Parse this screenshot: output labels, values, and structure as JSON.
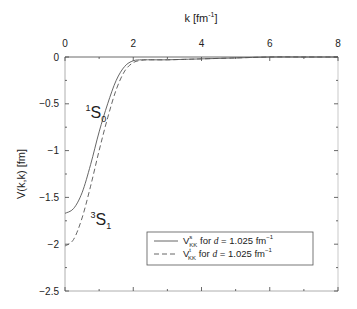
{
  "chart_data": {
    "type": "line",
    "title": "",
    "xlabel": "k [fm^-1]",
    "xlabel_main": "k [fm",
    "xlabel_sup": "-1",
    "xlabel_close": "]",
    "ylabel": "V(k,k) [fm]",
    "xlim": [
      0,
      8
    ],
    "ylim": [
      -2.5,
      0
    ],
    "x_axis_position": "top",
    "xticks": [
      0,
      2,
      4,
      6,
      8
    ],
    "xtick_labels": [
      "0",
      "2",
      "4",
      "6",
      "8"
    ],
    "yticks": [
      0,
      -0.5,
      -1,
      -1.5,
      -2,
      -2.5
    ],
    "ytick_labels": [
      "0",
      "-0.5",
      "-1",
      "-1.5",
      "-2",
      "-2.5"
    ],
    "grid": false,
    "legend_position": "lower right",
    "series": [
      {
        "name": "V^s_KK for d = 1.025 fm^-1",
        "style": "solid",
        "annotation": "1S0",
        "x": [
          0,
          0.25,
          0.5,
          0.75,
          1.0,
          1.25,
          1.5,
          1.75,
          2.0,
          2.25,
          2.5,
          3.0,
          3.5,
          4.0,
          5.0,
          6.0,
          7.0,
          8.0
        ],
        "values": [
          -1.67,
          -1.62,
          -1.45,
          -1.15,
          -0.8,
          -0.5,
          -0.25,
          -0.1,
          -0.04,
          -0.03,
          -0.03,
          -0.03,
          -0.025,
          -0.02,
          -0.01,
          0.0,
          0.0,
          0.0
        ]
      },
      {
        "name": "V^t_KK for d = 1.025 fm^-1",
        "style": "dashed",
        "annotation": "3S1",
        "x": [
          0,
          0.25,
          0.5,
          0.75,
          1.0,
          1.25,
          1.5,
          1.75,
          2.0,
          2.25,
          2.5,
          3.0,
          3.5,
          4.0,
          5.0,
          6.0,
          7.0,
          8.0
        ],
        "values": [
          -2.02,
          -1.95,
          -1.72,
          -1.38,
          -1.0,
          -0.65,
          -0.35,
          -0.15,
          -0.06,
          -0.035,
          -0.03,
          -0.03,
          -0.025,
          -0.02,
          -0.01,
          0.0,
          0.0,
          0.0
        ]
      }
    ],
    "annotations": [
      {
        "pre_sup": "1",
        "main": "S",
        "sub": "0",
        "x": 0.6,
        "y": -0.65
      },
      {
        "pre_sup": "3",
        "main": "S",
        "sub": "1",
        "x": 0.75,
        "y": -1.8
      }
    ],
    "legend": [
      {
        "main": "V",
        "sup": "s",
        "sub": "KK",
        "for": " for ",
        "d": "d",
        "eq": " = 1.025 fm",
        "unit_sup": "-1"
      },
      {
        "main": "V",
        "sup": "t",
        "sub": "KK",
        "for": " for ",
        "d": "d",
        "eq": " = 1.025 fm",
        "unit_sup": "-1"
      }
    ]
  }
}
